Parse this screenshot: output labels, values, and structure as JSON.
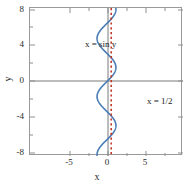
{
  "figure": {
    "width": 194,
    "height": 187,
    "background": "#ffffff"
  },
  "axis": {
    "xlabel": "x",
    "ylabel": "y",
    "x_ticks": [
      "-5",
      "0",
      "5"
    ],
    "y_ticks": [
      "8",
      "4",
      "0",
      "-4",
      "-8"
    ],
    "frame_color": "#9a9a9a",
    "zero_line_color": "#7a7a7a"
  },
  "annotations": {
    "sine_label": "x = sin y",
    "half_label": "x = 1/2"
  },
  "colors": {
    "curve_blue": "#4a7db5",
    "dashed_red": "#c0392b",
    "axis_gray": "#9a9a9a",
    "text": "#1c1c1c"
  },
  "chart_data": {
    "type": "line",
    "title": "",
    "xlabel": "x",
    "ylabel": "y",
    "xlim": [
      -8.1,
      8.1
    ],
    "ylim": [
      -8,
      8
    ],
    "xticks": [
      -5,
      0,
      5
    ],
    "yticks": [
      -8,
      -4,
      0,
      4,
      8
    ],
    "grid": false,
    "legend": "none (inline annotations)",
    "series": [
      {
        "name": "x = sin y",
        "color": "#4a7db5",
        "style": "solid",
        "orientation": "x-as-function-of-y",
        "equation": "x = sin(y)",
        "amplitude": 1,
        "y_range": [
          -8,
          8
        ],
        "annotation": "x = sin y",
        "points": [
          {
            "y": -8.0,
            "x": -0.989
          },
          {
            "y": -7.5,
            "x": -0.938
          },
          {
            "y": -7.0,
            "x": -0.657
          },
          {
            "y": -6.5,
            "x": -0.216
          },
          {
            "y": -6.0,
            "x": 0.279
          },
          {
            "y": -5.5,
            "x": 0.706
          },
          {
            "y": -5.0,
            "x": 0.959
          },
          {
            "y": -4.712,
            "x": 1.0
          },
          {
            "y": -4.5,
            "x": 0.978
          },
          {
            "y": -4.0,
            "x": 0.757
          },
          {
            "y": -3.5,
            "x": 0.351
          },
          {
            "y": -3.1416,
            "x": 0.0
          },
          {
            "y": -3.0,
            "x": -0.141
          },
          {
            "y": -2.5,
            "x": -0.599
          },
          {
            "y": -2.0,
            "x": -0.909
          },
          {
            "y": -1.571,
            "x": -1.0
          },
          {
            "y": -1.5,
            "x": -0.997
          },
          {
            "y": -1.0,
            "x": -0.841
          },
          {
            "y": -0.5,
            "x": -0.479
          },
          {
            "y": 0.0,
            "x": 0.0
          },
          {
            "y": 0.5,
            "x": 0.479
          },
          {
            "y": 1.0,
            "x": 0.841
          },
          {
            "y": 1.571,
            "x": 1.0
          },
          {
            "y": 2.0,
            "x": 0.909
          },
          {
            "y": 2.5,
            "x": 0.599
          },
          {
            "y": 3.1416,
            "x": 0.0
          },
          {
            "y": 3.5,
            "x": -0.351
          },
          {
            "y": 4.0,
            "x": -0.757
          },
          {
            "y": 4.712,
            "x": -1.0
          },
          {
            "y": 5.0,
            "x": -0.959
          },
          {
            "y": 5.5,
            "x": -0.706
          },
          {
            "y": 6.0,
            "x": -0.279
          },
          {
            "y": 6.2832,
            "x": 0.0
          },
          {
            "y": 6.5,
            "x": 0.216
          },
          {
            "y": 7.0,
            "x": 0.657
          },
          {
            "y": 7.5,
            "x": 0.938
          },
          {
            "y": 7.854,
            "x": 1.0
          },
          {
            "y": 8.0,
            "x": 0.989
          }
        ]
      },
      {
        "name": "x = 1/2",
        "color": "#c0392b",
        "style": "dotted-vertical",
        "equation": "x = 0.5",
        "x_value": 0.5,
        "y_range": [
          -8,
          8
        ],
        "annotation": "x = 1/2"
      }
    ]
  }
}
